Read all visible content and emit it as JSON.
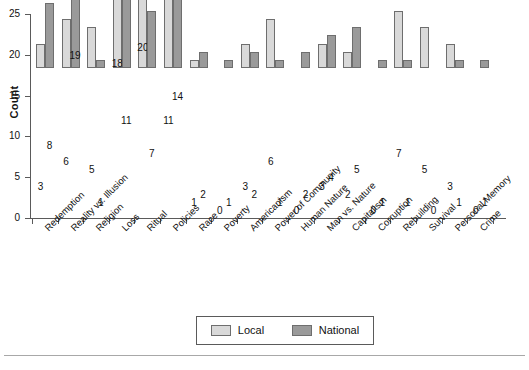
{
  "chart_data": {
    "type": "bar",
    "title": "",
    "subtitle": "",
    "xlabel": "",
    "ylabel": "Count",
    "ylim": [
      0,
      25
    ],
    "yticks": [
      0,
      5,
      10,
      15,
      20,
      25
    ],
    "grid": false,
    "legend_position": "bottom",
    "bar_labels": true,
    "categories": [
      "Redemption",
      "Reality vs. Illusion",
      "Religion",
      "Loss",
      "Ritual",
      "Policies",
      "Race",
      "Poverty",
      "Americanism",
      "Power of Community",
      "Human Nature",
      "Man vs. Nature",
      "Capitalism",
      "Corruption",
      "Rebuilding",
      "Survival",
      "Personal Memory",
      "Crime"
    ],
    "series": [
      {
        "name": "Local",
        "color": "#d9d9d9",
        "values": [
          3,
          6,
          5,
          18,
          20,
          11,
          1,
          0,
          3,
          6,
          0,
          3,
          2,
          0,
          7,
          5,
          3,
          0
        ]
      },
      {
        "name": "National",
        "color": "#9a9a9a",
        "values": [
          8,
          19,
          1,
          11,
          7,
          14,
          2,
          1,
          2,
          1,
          2,
          4,
          5,
          1,
          1,
          0,
          1,
          1
        ]
      }
    ]
  },
  "legend": {
    "entries": [
      {
        "label": "Local"
      },
      {
        "label": "National"
      }
    ]
  },
  "colors": {
    "local": "#d9d9d9",
    "national": "#9a9a9a",
    "axis": "#5a5a5a",
    "bar_outline": "#6e6e6e",
    "background": "#ffffff"
  }
}
